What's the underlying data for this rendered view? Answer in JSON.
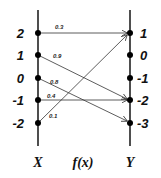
{
  "diagram": {
    "type": "mapping",
    "x_axis": {
      "label": "X",
      "values": [
        "2",
        "1",
        "0",
        "-1",
        "-2"
      ]
    },
    "y_axis": {
      "label": "Y",
      "values": [
        "1",
        "0",
        "-1",
        "-2",
        "-3"
      ]
    },
    "function_label": "f(x)",
    "mappings": [
      {
        "from": "2",
        "to": "1",
        "weight": "0.3"
      },
      {
        "from": "1",
        "to": "-2",
        "weight": "0.9"
      },
      {
        "from": "0",
        "to": "-3",
        "weight": "0.8"
      },
      {
        "from": "-1",
        "to": "-2",
        "weight": "0.4"
      },
      {
        "from": "-2",
        "to": "1",
        "weight": "0.1"
      }
    ],
    "colors": {
      "line": "#222222",
      "dot": "#000000",
      "background": "#ffffff"
    }
  }
}
